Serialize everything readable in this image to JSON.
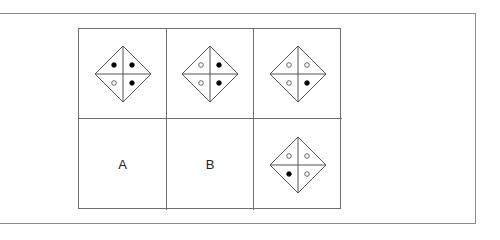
{
  "figure": {
    "rows": 2,
    "cols": 3,
    "cells": [
      {
        "row": 1,
        "col": 1,
        "type": "diamond",
        "dots": {
          "top_left": "filled",
          "top_right": "filled",
          "bottom_left": "open",
          "bottom_right": "filled"
        }
      },
      {
        "row": 1,
        "col": 2,
        "type": "diamond",
        "dots": {
          "top_left": "open",
          "top_right": "filled",
          "bottom_left": "open",
          "bottom_right": "filled"
        }
      },
      {
        "row": 1,
        "col": 3,
        "type": "diamond",
        "dots": {
          "top_left": "open",
          "top_right": "open",
          "bottom_left": "open",
          "bottom_right": "filled"
        }
      },
      {
        "row": 2,
        "col": 1,
        "type": "label",
        "label": "A"
      },
      {
        "row": 2,
        "col": 2,
        "type": "label",
        "label": "B"
      },
      {
        "row": 2,
        "col": 3,
        "type": "diamond",
        "dots": {
          "top_left": "open",
          "top_right": "open",
          "bottom_left": "filled",
          "bottom_right": "open"
        }
      }
    ]
  },
  "labels": {
    "a": "A",
    "b": "B"
  },
  "colors": {
    "line": "#555555",
    "filled_dot": "#000000",
    "open_dot": "#ffffff",
    "frame": "#8c8c8c"
  }
}
